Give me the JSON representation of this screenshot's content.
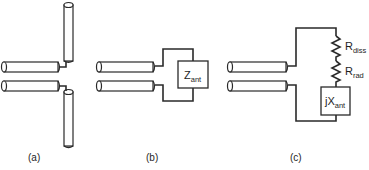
{
  "figure": {
    "panels": [
      {
        "id": "a",
        "caption": "(a)",
        "description": "Dipole antenna fed by two-wire transmission line"
      },
      {
        "id": "b",
        "caption": "(b)",
        "description": "Antenna replaced by equivalent impedance",
        "box_label": {
          "main": "Z",
          "sub": "ant"
        }
      },
      {
        "id": "c",
        "caption": "(c)",
        "description": "Equivalent circuit: series resistances and reactance",
        "components": [
          {
            "type": "resistor",
            "label": {
              "main": "R",
              "sub": "diss"
            }
          },
          {
            "type": "resistor",
            "label": {
              "main": "R",
              "sub": "rad"
            }
          },
          {
            "type": "reactance",
            "label": {
              "main": "jX",
              "sub": "ant"
            }
          }
        ]
      }
    ],
    "colors": {
      "line": "#2a2a2a",
      "background": "#ffffff"
    }
  }
}
